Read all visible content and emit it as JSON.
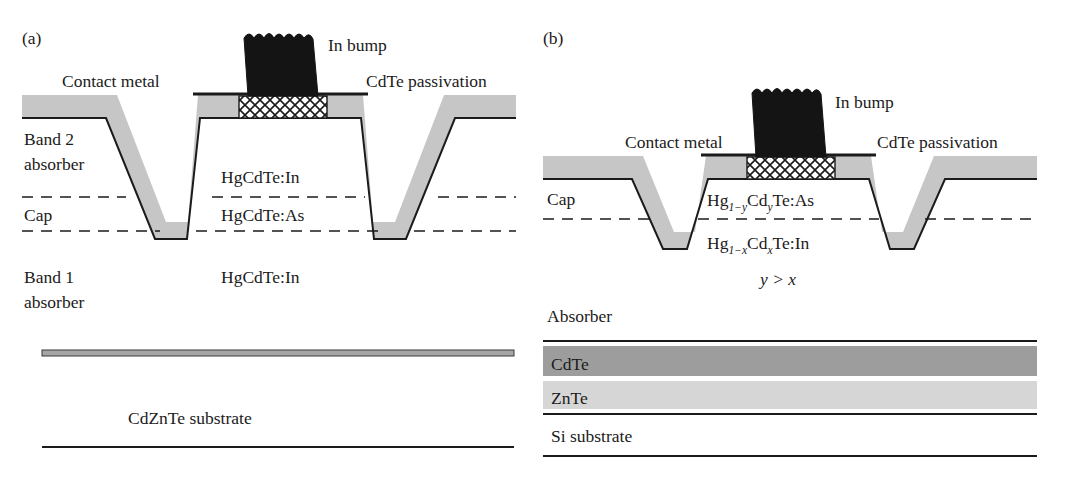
{
  "figure": {
    "type": "device-cross-section-diagram",
    "panels": [
      {
        "id": "a",
        "tag": "(a)",
        "substrate_name": "CdZnTe substrate",
        "labels": {
          "in_bump": "In bump",
          "contact_metal": "Contact metal",
          "cdte_passivation": "CdTe passivation",
          "band2_line1": "Band 2",
          "band2_line2": "absorber",
          "cap": "Cap",
          "band1_line1": "Band 1",
          "band1_line2": "absorber",
          "layer_top": "HgCdTe:In",
          "layer_mid": "HgCdTe:As",
          "layer_bottom": "HgCdTe:In",
          "substrate": "CdZnTe substrate"
        }
      },
      {
        "id": "b",
        "tag": "(b)",
        "substrate_name": "Si substrate",
        "labels": {
          "in_bump": "In bump",
          "contact_metal": "Contact metal",
          "cdte_passivation": "CdTe passivation",
          "cap": "Cap",
          "absorber": "Absorber",
          "condition": "y > x",
          "buffer_cdte": "CdTe",
          "buffer_znte": "ZnTe",
          "substrate": "Si substrate"
        },
        "formulas": {
          "cap_layer": {
            "lead": "Hg",
            "sub1": "1−y",
            "mid": "Cd",
            "sub2": "y",
            "tail": "Te:As",
            "plain": "Hg1−yCdyTe:As"
          },
          "absorber_layer": {
            "lead": "Hg",
            "sub1": "1−x",
            "mid": "Cd",
            "sub2": "x",
            "tail": "Te:In",
            "plain": "Hg1−xCdxTe:In"
          }
        }
      }
    ],
    "colors": {
      "passivation_grey": "#c6c6c6",
      "cdte_buffer_grey": "#9d9d9d",
      "znte_buffer_grey": "#d6d6d6",
      "in_bump_black": "#141414",
      "line_dark": "#1b1b1b",
      "background": "#ffffff"
    }
  }
}
